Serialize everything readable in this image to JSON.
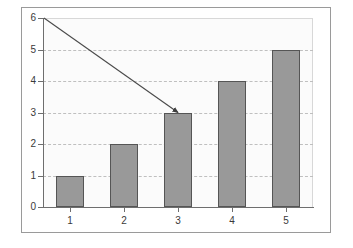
{
  "chart_data": {
    "type": "bar",
    "title": "",
    "subtitle": "",
    "xlabel": "",
    "ylabel": "",
    "categories": [
      "1",
      "2",
      "3",
      "4",
      "5"
    ],
    "values": [
      1,
      2,
      3,
      4,
      5
    ],
    "series": [
      {
        "name": "Series 1",
        "values": [
          1,
          2,
          3,
          4,
          5
        ]
      }
    ],
    "ylim": [
      0,
      6
    ],
    "ytick_labels": [
      "0",
      "1",
      "2",
      "3",
      "4",
      "5",
      "6"
    ],
    "ytick_values": [
      0,
      1,
      2,
      3,
      4,
      5,
      6
    ],
    "xtick_labels": [
      "1",
      "2",
      "3",
      "4",
      "5"
    ],
    "grid": true,
    "grid_axis": "y",
    "legend": false,
    "legend_position": "none",
    "annotations": [
      {
        "kind": "arrow",
        "label": "",
        "from_x": 1,
        "from_y": 6,
        "to_x": 3,
        "to_y": 3
      }
    ],
    "colors": {
      "bar_fill": "#999999",
      "bar_border": "#555555",
      "gridline": "#bfbfbf",
      "axis": "#6e6e6e",
      "frame_border": "#9a9a9a",
      "plot_background": "#fbfbfb",
      "page_background": "#ffffff",
      "tick_label": "#3a3a3a",
      "annotation_arrow": "#4a4a4a"
    }
  }
}
